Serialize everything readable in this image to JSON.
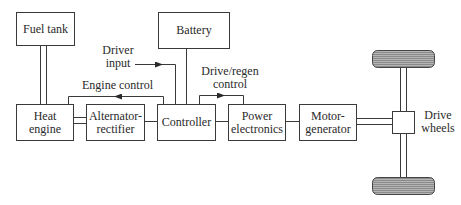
{
  "diagram": {
    "type": "block-diagram",
    "title": "",
    "blocks": {
      "fuel_tank": "Fuel tank",
      "battery": "Battery",
      "heat_engine_1": "Heat",
      "heat_engine_2": "engine",
      "alternator_1": "Alternator-",
      "alternator_2": "rectifier",
      "controller": "Controller",
      "power_1": "Power",
      "power_2": "electronics",
      "motor_1": "Motor-",
      "motor_2": "generator"
    },
    "labels": {
      "driver_input_1": "Driver",
      "driver_input_2": "input",
      "engine_control": "Engine control",
      "drive_regen_1": "Drive/regen",
      "drive_regen_2": "control",
      "drive_wheels_1": "Drive",
      "drive_wheels_2": "wheels"
    },
    "connections": [
      {
        "from": "Fuel tank",
        "to": "Heat engine",
        "style": "double-line"
      },
      {
        "from": "Heat engine",
        "to": "Alternator-rectifier",
        "style": "double-line"
      },
      {
        "from": "Alternator-rectifier",
        "to": "Controller",
        "style": "single-line"
      },
      {
        "from": "Battery",
        "to": "Controller",
        "style": "single-line"
      },
      {
        "from": "Driver input",
        "to": "Controller",
        "style": "arrow"
      },
      {
        "from": "Controller",
        "to": "Heat engine",
        "style": "arrow",
        "label": "Engine control"
      },
      {
        "from": "Controller",
        "to": "Power electronics",
        "style": "arrow",
        "label": "Drive/regen control"
      },
      {
        "from": "Controller",
        "to": "Power electronics",
        "style": "single-line"
      },
      {
        "from": "Power electronics",
        "to": "Motor-generator",
        "style": "single-line"
      },
      {
        "from": "Motor-generator",
        "to": "Drive wheels",
        "style": "double-line"
      }
    ]
  }
}
